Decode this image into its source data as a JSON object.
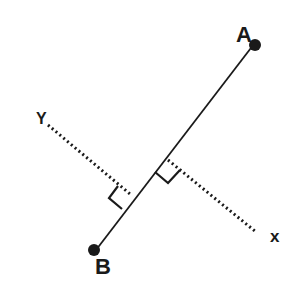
{
  "diagram": {
    "points": {
      "A": {
        "label": "A",
        "x": 254,
        "y": 44
      },
      "B": {
        "label": "B",
        "x": 95,
        "y": 250
      }
    },
    "axes": {
      "x": {
        "label": "x"
      },
      "y": {
        "label": "Y"
      }
    },
    "colors": {
      "ink": "#1a1a1a",
      "background": "#ffffff"
    }
  }
}
